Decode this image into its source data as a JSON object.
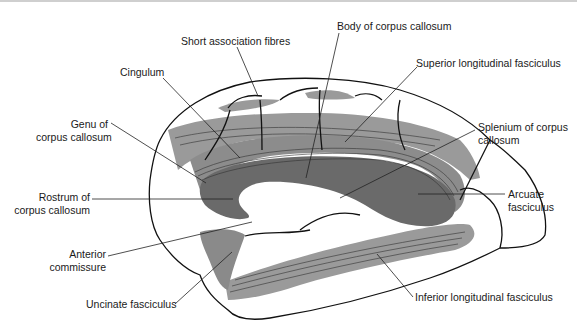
{
  "diagram": {
    "colors": {
      "light_fibre": "#9a9a9a",
      "dark_fibre": "#6a6a6a",
      "outline": "#111111",
      "leader": "#222222"
    }
  },
  "labels": {
    "short_association": {
      "lines": [
        "Short association fibres"
      ]
    },
    "body_cc": {
      "lines": [
        "Body of corpus callosum"
      ]
    },
    "cingulum": {
      "lines": [
        "Cingulum"
      ]
    },
    "superior_lf": {
      "lines": [
        "Superior longitudinal fasciculus"
      ]
    },
    "genu_cc": {
      "lines": [
        "Genu of",
        "corpus callosum"
      ]
    },
    "splenium_cc": {
      "lines": [
        "Splenium of corpus",
        "callosum"
      ]
    },
    "rostrum_cc": {
      "lines": [
        "Rostrum of",
        "corpus callosum"
      ]
    },
    "arcuate": {
      "lines": [
        "Arcuate",
        "fasciculus"
      ]
    },
    "anterior_commissure": {
      "lines": [
        "Anterior",
        "commissure"
      ]
    },
    "uncinate": {
      "lines": [
        "Uncinate fasciculus"
      ]
    },
    "inferior_lf": {
      "lines": [
        "Inferior longitudinal fasciculus"
      ]
    }
  }
}
